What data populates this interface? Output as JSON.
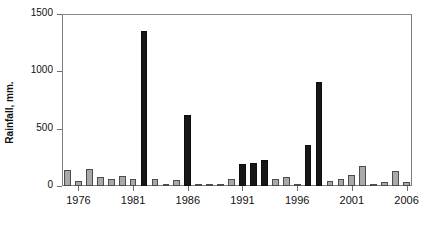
{
  "chart_data": {
    "type": "bar",
    "title": "",
    "subtitle": "",
    "xlabel": "",
    "ylabel": "Rainfall, mm.",
    "ylim": [
      0,
      1500
    ],
    "xlim": [
      1974.5,
      2006.5
    ],
    "grid": false,
    "legend": null,
    "y_ticks": [
      0,
      500,
      1000,
      1500
    ],
    "y_tick_labels": [
      "0",
      "500",
      "1000",
      "1500"
    ],
    "x_ticks": [
      1976,
      1981,
      1986,
      1991,
      1996,
      2001,
      2006
    ],
    "x_tick_labels": [
      "1976",
      "1981",
      "1986",
      "1991",
      "1996",
      "2001",
      "2006"
    ],
    "categories": [
      1975,
      1976,
      1977,
      1978,
      1979,
      1980,
      1981,
      1982,
      1983,
      1984,
      1985,
      1986,
      1987,
      1988,
      1989,
      1990,
      1991,
      1992,
      1993,
      1994,
      1995,
      1996,
      1997,
      1998,
      1999,
      2000,
      2001,
      2002,
      2003,
      2004,
      2005,
      2006
    ],
    "values": [
      140,
      40,
      145,
      80,
      65,
      85,
      65,
      1355,
      60,
      10,
      55,
      615,
      5,
      0,
      10,
      65,
      190,
      200,
      230,
      65,
      80,
      0,
      355,
      910,
      45,
      60,
      100,
      175,
      20,
      35,
      130,
      35
    ],
    "colors": [
      "gray",
      "gray",
      "gray",
      "gray",
      "gray",
      "gray",
      "gray",
      "black",
      "gray",
      "gray",
      "gray",
      "black",
      "gray",
      "gray",
      "gray",
      "gray",
      "black",
      "black",
      "black",
      "gray",
      "gray",
      "gray",
      "black",
      "black",
      "gray",
      "gray",
      "gray",
      "gray",
      "gray",
      "gray",
      "gray",
      "gray"
    ],
    "color_map": {
      "gray": "#a9a9a9",
      "black": "#171717",
      "border_gray": "#4c4c4c",
      "border_black": "#0d0d0d",
      "axis": "#7d7d7d",
      "text": "#111111"
    }
  }
}
